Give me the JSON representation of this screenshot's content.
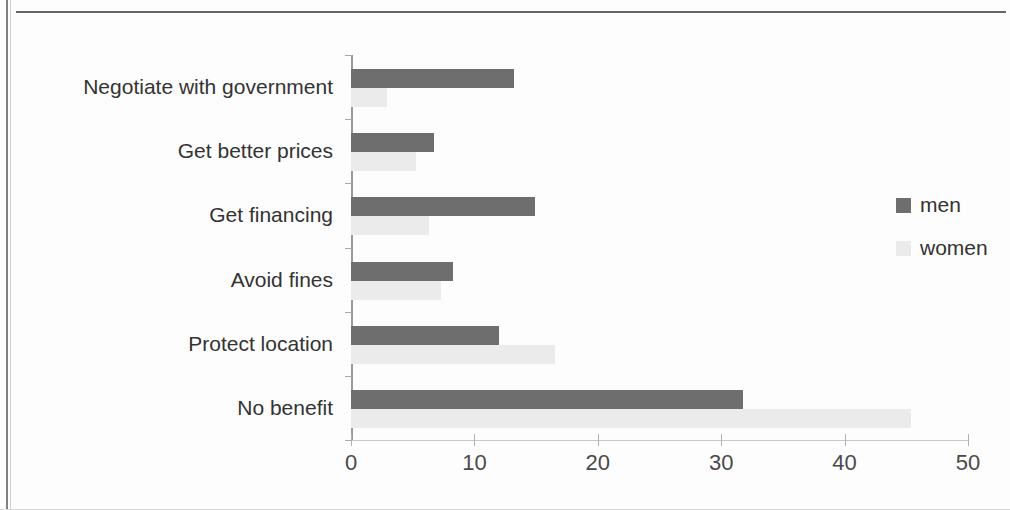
{
  "chart_data": {
    "type": "bar",
    "orientation": "horizontal",
    "title": "",
    "xlabel": "",
    "ylabel": "",
    "xlim": [
      0,
      50
    ],
    "xticks": [
      0,
      10,
      20,
      30,
      40,
      50
    ],
    "xtick_labels": [
      "0",
      "10",
      "20",
      "30",
      "40",
      "50"
    ],
    "grid": false,
    "legend_position": "right",
    "categories": [
      "Negotiate with government",
      "Get better prices",
      "Get financing",
      "Avoid fines",
      "Protect location",
      "No benefit"
    ],
    "series": [
      {
        "name": "men",
        "color": "#6e6e6e",
        "values": [
          13.2,
          6.7,
          14.9,
          8.3,
          12.0,
          31.8
        ]
      },
      {
        "name": "women",
        "color": "#ebebeb",
        "values": [
          2.9,
          5.3,
          6.3,
          7.3,
          16.5,
          45.4
        ]
      }
    ]
  },
  "legend": {
    "items": [
      {
        "label": "men",
        "color": "#6e6e6e"
      },
      {
        "label": "women",
        "color": "#ebebeb"
      }
    ]
  }
}
